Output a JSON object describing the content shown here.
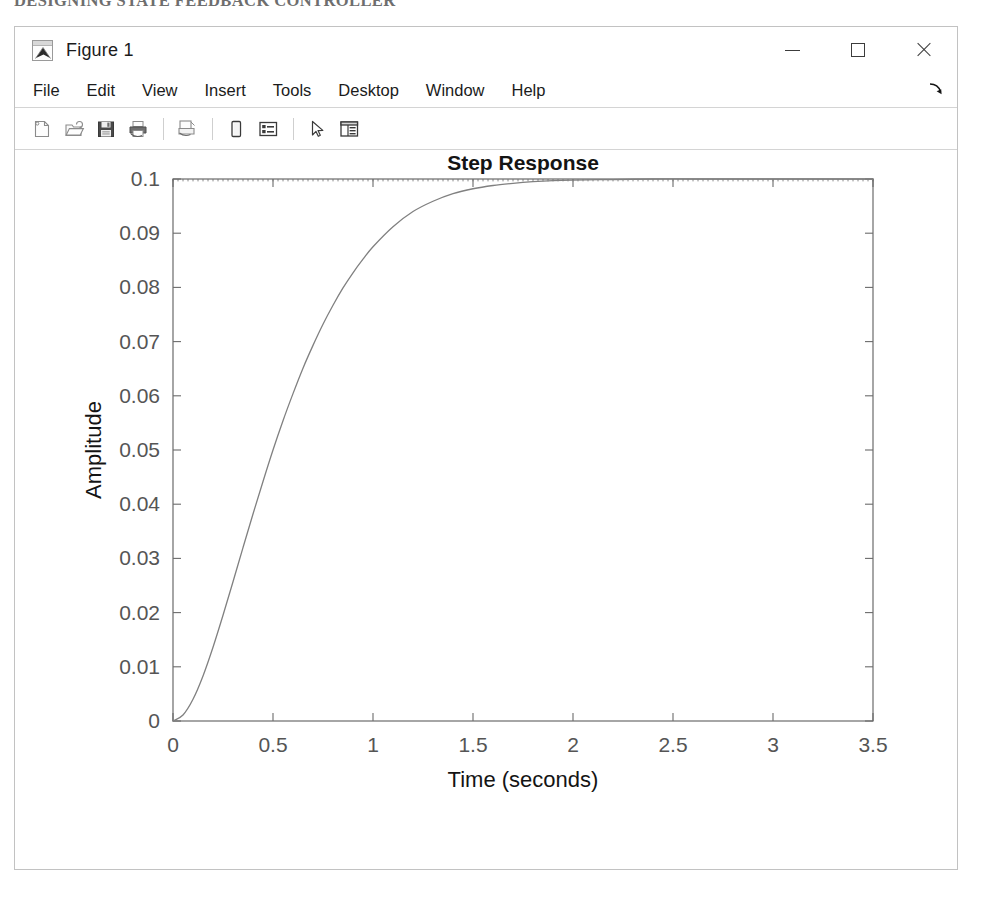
{
  "page_header": "DESIGNING STATE FEEDBACK CONTROLLER",
  "window": {
    "title": "Figure 1",
    "app_icon": "matlab-membrane-icon",
    "controls": [
      {
        "name": "minimize",
        "glyph": "—"
      },
      {
        "name": "maximize",
        "glyph": "□"
      },
      {
        "name": "close",
        "glyph": "✕"
      }
    ]
  },
  "menubar": {
    "items": [
      {
        "label": "File"
      },
      {
        "label": "Edit"
      },
      {
        "label": "View"
      },
      {
        "label": "Insert"
      },
      {
        "label": "Tools"
      },
      {
        "label": "Desktop"
      },
      {
        "label": "Window"
      },
      {
        "label": "Help"
      }
    ],
    "undock_icon": "arrow-down-right-icon"
  },
  "toolbar": {
    "buttons": [
      {
        "icon": "new-figure-icon",
        "tooltip": "New Figure"
      },
      {
        "icon": "open-file-icon",
        "tooltip": "Open File"
      },
      {
        "icon": "save-figure-icon",
        "tooltip": "Save Figure"
      },
      {
        "icon": "print-figure-icon",
        "tooltip": "Print Figure"
      },
      {
        "icon": "print-preview-icon",
        "tooltip": "Print Preview"
      },
      {
        "icon": "insert-colorbar-icon",
        "tooltip": "Insert Colorbar"
      },
      {
        "icon": "insert-legend-icon",
        "tooltip": "Insert Legend"
      },
      {
        "icon": "edit-plot-arrow-icon",
        "tooltip": "Edit Plot"
      },
      {
        "icon": "property-inspector-icon",
        "tooltip": "Open Property Inspector"
      }
    ]
  },
  "chart_data": {
    "type": "line",
    "title": "Step Response",
    "xlabel": "Time (seconds)",
    "ylabel": "Amplitude",
    "xlim": [
      0,
      3.5
    ],
    "ylim": [
      0,
      0.1
    ],
    "xticks": [
      "0",
      "0.5",
      "1",
      "1.5",
      "2",
      "2.5",
      "3",
      "3.5"
    ],
    "xtick_values": [
      0,
      0.5,
      1,
      1.5,
      2,
      2.5,
      3,
      3.5
    ],
    "yticks": [
      "0",
      "0.01",
      "0.02",
      "0.03",
      "0.04",
      "0.05",
      "0.06",
      "0.07",
      "0.08",
      "0.09",
      "0.1"
    ],
    "ytick_values": [
      0,
      0.01,
      0.02,
      0.03,
      0.04,
      0.05,
      0.06,
      0.07,
      0.08,
      0.09,
      0.1
    ],
    "grid": false,
    "legend": null,
    "box": true,
    "line_color": "#808080",
    "series": [
      {
        "name": "step response",
        "x": [
          0,
          0.05,
          0.1,
          0.15,
          0.2,
          0.25,
          0.3,
          0.35,
          0.4,
          0.45,
          0.5,
          0.55,
          0.6,
          0.65,
          0.7,
          0.75,
          0.8,
          0.85,
          0.9,
          0.95,
          1.0,
          1.1,
          1.2,
          1.3,
          1.4,
          1.5,
          1.6,
          1.7,
          1.8,
          1.9,
          2.0,
          2.2,
          2.4,
          2.6,
          2.8,
          3.0,
          3.2,
          3.4,
          3.5
        ],
        "y": [
          0,
          0.0011,
          0.004,
          0.0083,
          0.0136,
          0.0195,
          0.0257,
          0.032,
          0.0382,
          0.0442,
          0.05,
          0.0554,
          0.0604,
          0.0651,
          0.0693,
          0.0732,
          0.0767,
          0.0799,
          0.0827,
          0.0852,
          0.0875,
          0.0912,
          0.094,
          0.0959,
          0.0973,
          0.0982,
          0.0988,
          0.0992,
          0.0995,
          0.0997,
          0.0998,
          0.0999,
          0.1,
          0.1,
          0.1,
          0.1,
          0.1,
          0.1,
          0.1
        ]
      }
    ]
  }
}
